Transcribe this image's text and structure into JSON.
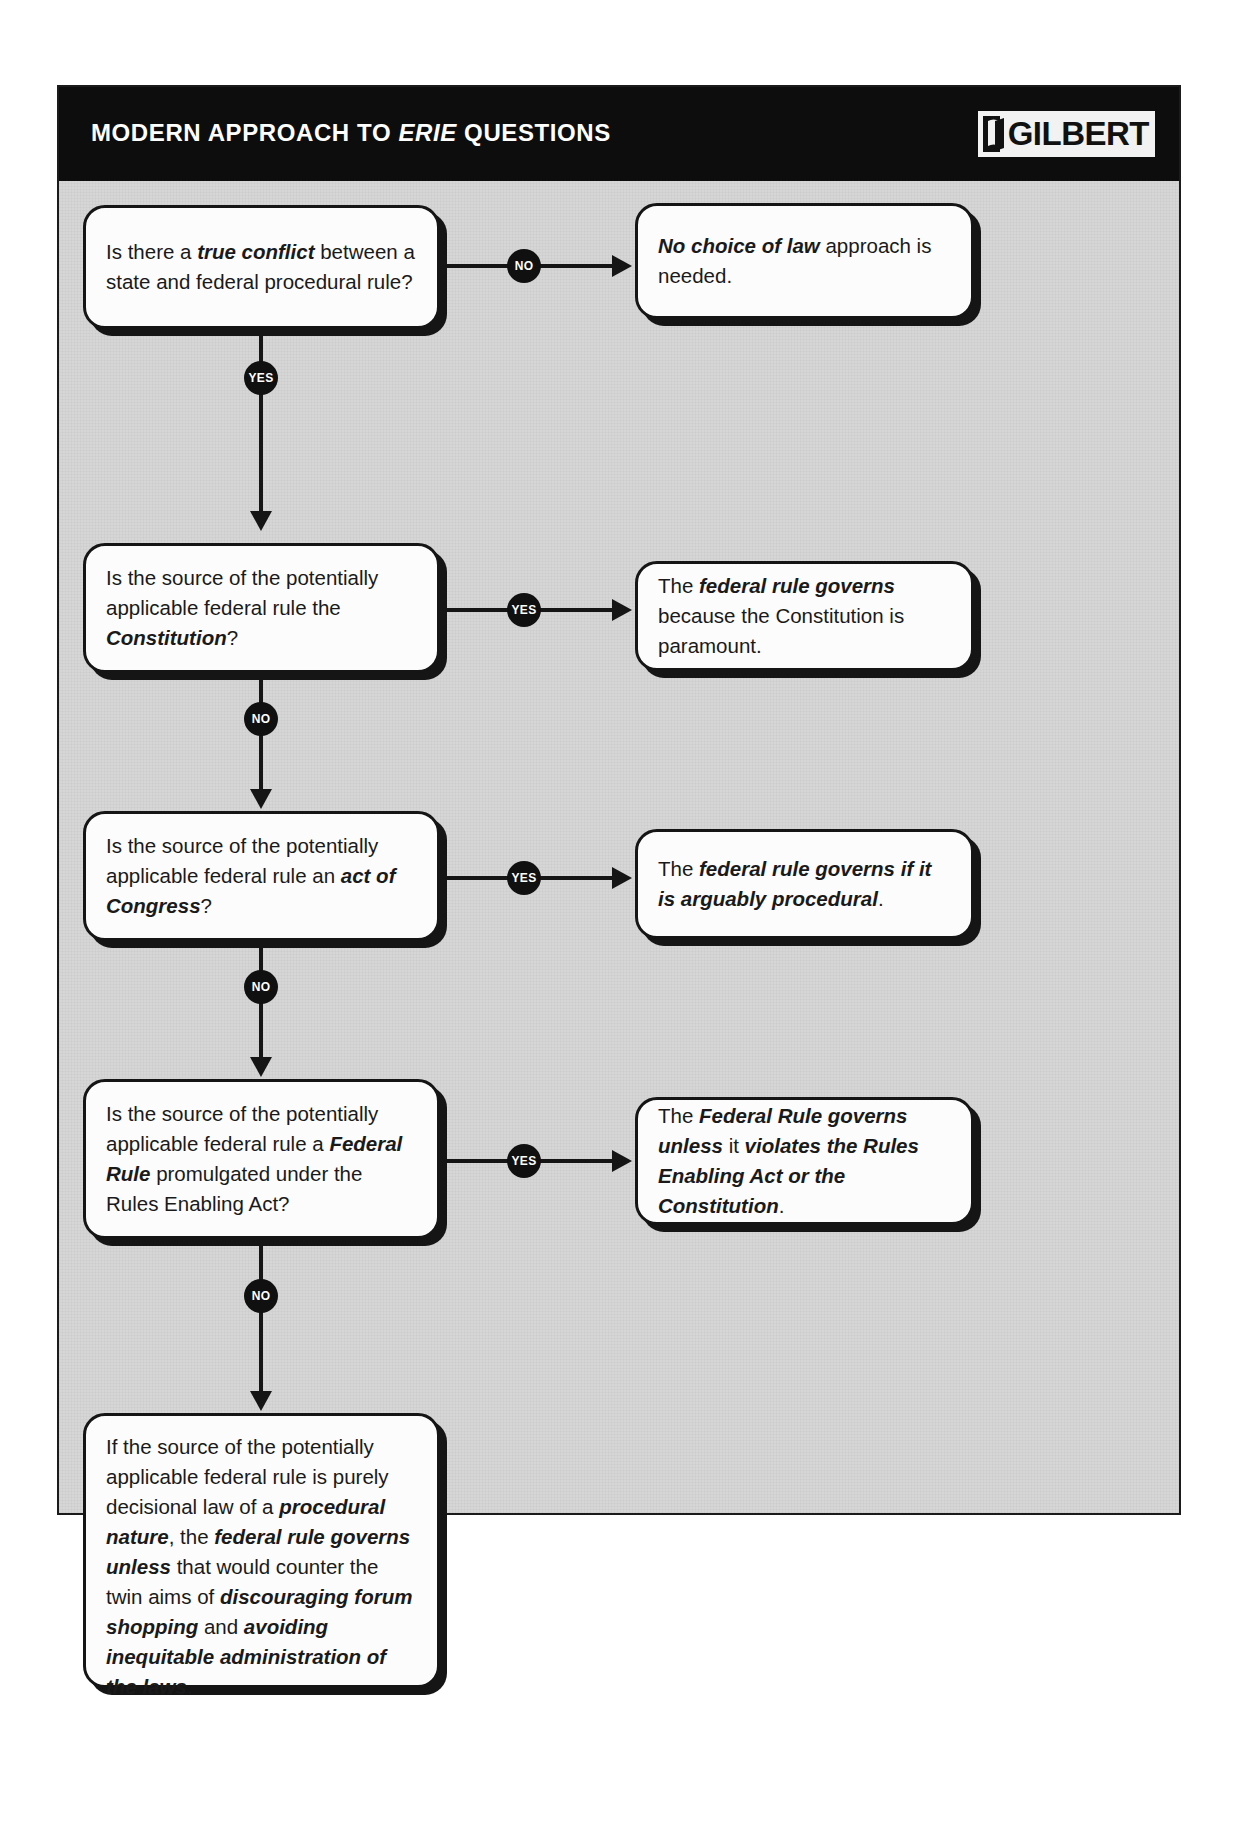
{
  "header": {
    "title_before": "MODERN APPROACH TO ",
    "title_italic": "ERIE",
    "title_after": " QUESTIONS",
    "title_full": "MODERN APPROACH TO ERIE QUESTIONS",
    "brand": "GILBERT",
    "brand_icon": "book-mark-icon",
    "bar_color": "#0d0d0d",
    "text_color": "#ffffff"
  },
  "flow": {
    "background_color": "#d6d6d6",
    "node_fill": "#fcfcfc",
    "node_stroke": "#151515",
    "badge_fill": "#101010",
    "badge_text_color": "#ffffff",
    "questions": [
      {
        "id": "q1",
        "html": "Is there a <b>true conflict</b> between a state and federal procedural rule?",
        "plain": "Is there a true conflict between a state and federal procedural rule?"
      },
      {
        "id": "q2",
        "html": "Is the source of the potentially applicable federal rule the <b>Constitution</b>?",
        "plain": "Is the source of the potentially applicable federal rule the Constitution?"
      },
      {
        "id": "q3",
        "html": "Is the source of the potentially applicable federal rule an <b>act of Congress</b>?",
        "plain": "Is the source of the potentially applicable federal rule an act of Congress?"
      },
      {
        "id": "q4",
        "html": "Is the source of the potentially applicable federal rule a <b>Federal Rule</b> promulgated under the Rules Enabling Act?",
        "plain": "Is the source of the potentially applicable federal rule a Federal Rule promulgated under the Rules Enabling Act?"
      },
      {
        "id": "q5",
        "html": "If the source of the potentially applicable federal rule is purely decisional law of a <b>procedural nature</b>, the <b>federal rule governs unless</b> that would counter the twin aims of <b>discouraging forum shopping</b> and <b>avoiding inequitable administration of the laws</b>.",
        "plain": "If the source of the potentially applicable federal rule is purely decisional law of a procedural nature, the federal rule governs unless that would counter the twin aims of discouraging forum shopping and avoiding inequitable administration of the laws."
      }
    ],
    "answers": [
      {
        "id": "a1",
        "html": "<b>No choice of law</b> approach is needed.",
        "plain": "No choice of law approach is needed."
      },
      {
        "id": "a2",
        "html": "The <b>federal rule governs</b> because the Constitution is paramount.",
        "plain": "The federal rule governs because the Constitution is paramount."
      },
      {
        "id": "a3",
        "html": "The <b>federal rule governs if it is arguably procedural</b>.",
        "plain": "The federal rule governs if it is arguably procedural."
      },
      {
        "id": "a4",
        "html": "The <b>Federal Rule governs unless</b> it <b>violates the Rules Enabling Act or the Constitution</b>.",
        "plain": "The Federal Rule governs unless it violates the Rules Enabling Act or the Constitution."
      }
    ],
    "badges": [
      {
        "id": "b1",
        "label": "NO",
        "direction": "right",
        "from": "q1",
        "to": "a1"
      },
      {
        "id": "b2",
        "label": "YES",
        "direction": "down",
        "from": "q1",
        "to": "q2"
      },
      {
        "id": "b3",
        "label": "YES",
        "direction": "right",
        "from": "q2",
        "to": "a2"
      },
      {
        "id": "b4",
        "label": "NO",
        "direction": "down",
        "from": "q2",
        "to": "q3"
      },
      {
        "id": "b5",
        "label": "YES",
        "direction": "right",
        "from": "q3",
        "to": "a3"
      },
      {
        "id": "b6",
        "label": "NO",
        "direction": "down",
        "from": "q3",
        "to": "q4"
      },
      {
        "id": "b7",
        "label": "YES",
        "direction": "right",
        "from": "q4",
        "to": "a4"
      },
      {
        "id": "b8",
        "label": "NO",
        "direction": "down",
        "from": "q4",
        "to": "q5"
      }
    ]
  }
}
